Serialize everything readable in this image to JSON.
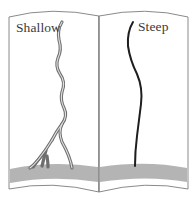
{
  "figure": {
    "type": "open-book-comparison",
    "panels": [
      {
        "label": "Shallow",
        "description": "Branching crack/root pattern drawn with double lines, splitting into several branches near the ground band"
      },
      {
        "label": "Steep",
        "description": "Single dark curved line descending to the ground band without branching"
      }
    ],
    "colors": {
      "outline": "#8a8a8a",
      "ground": "#b4b4b4",
      "shallow_stroke_outer": "#6e6e6e",
      "shallow_stroke_inner": "#d8d8d8",
      "steep_stroke": "#1e1e1e",
      "label": "#3a3a3a",
      "background": "#ffffff"
    }
  }
}
